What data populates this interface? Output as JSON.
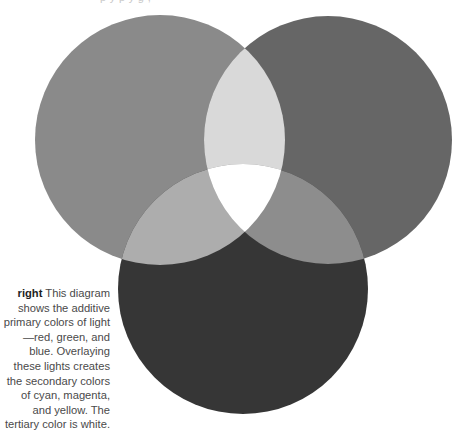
{
  "diagram": {
    "title": "Additive primary colors of light",
    "circles": [
      {
        "name": "red",
        "cx": 160,
        "cy": 140,
        "r": 125,
        "fill": "#8a8a8a"
      },
      {
        "name": "green",
        "cx": 328,
        "cy": 140,
        "r": 124,
        "fill": "#666666"
      },
      {
        "name": "blue",
        "cx": 243,
        "cy": 289,
        "r": 125,
        "fill": "#363636"
      }
    ],
    "overlaps": {
      "red_green": {
        "label": "yellow",
        "fill": "#d9d9d9"
      },
      "red_blue": {
        "label": "magenta",
        "fill": "#adadad"
      },
      "green_blue": {
        "label": "cyan",
        "fill": "#8d8d8d"
      },
      "all": {
        "label": "white",
        "fill": "#ffffff"
      }
    },
    "background": "#ffffff"
  },
  "caption": {
    "lead": "right",
    "body": " This diagram shows the additive primary colors of light—red, green, and blue. Overlaying these lights creates the secondary colors of cyan, magenta, and yellow. The tertiary color is white."
  },
  "top_fragment": {
    "text": "p  y  p    y  g    ,     "
  }
}
